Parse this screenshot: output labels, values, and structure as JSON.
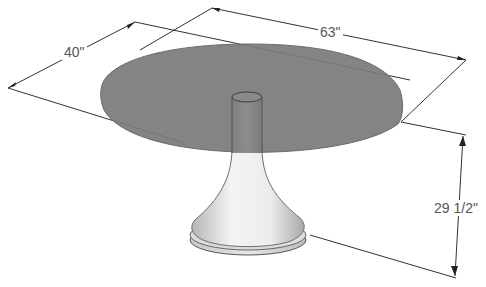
{
  "diagram": {
    "dimensions": {
      "length": {
        "label": "63\""
      },
      "width": {
        "label": "40\""
      },
      "height": {
        "label": "29 1/2\""
      }
    },
    "colors": {
      "background": "#ffffff",
      "tabletop": "#7a7a7a",
      "tabletop_edge": "#6a6a6a",
      "pedestal_light": "#f2f2f2",
      "pedestal_shadow": "#a8a8a8",
      "column": "#8a8a8a",
      "dimension_line": "#333333",
      "label_text": "#555555"
    }
  }
}
